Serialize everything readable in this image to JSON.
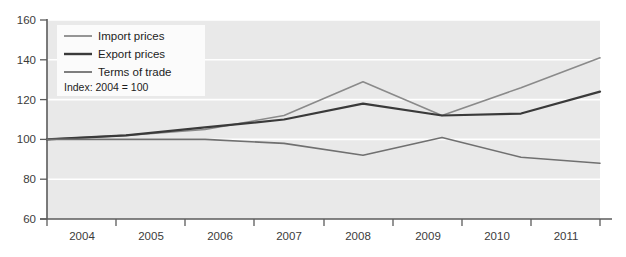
{
  "chart_data": {
    "type": "line",
    "title": "",
    "subtitle": "",
    "xlabel": "",
    "ylabel": "",
    "annotation": "Index: 2004 = 100",
    "legend_position": "top-left",
    "grid": true,
    "x": [
      "2004",
      "2005",
      "2006",
      "2007",
      "2008",
      "2009",
      "2010",
      "2011"
    ],
    "categories": [
      "2004",
      "2005",
      "2006",
      "2007",
      "2008",
      "2009",
      "2010",
      "2011"
    ],
    "xlim": [
      2004,
      2011
    ],
    "ylim": [
      60,
      160
    ],
    "yticks": [
      "60",
      "80",
      "100",
      "120",
      "140",
      "160"
    ],
    "series": [
      {
        "name": "Import prices",
        "color": "#8a8a8a",
        "values": [
          100,
          102,
          105,
          112,
          129,
          112,
          126,
          141
        ]
      },
      {
        "name": "Export prices",
        "color": "#3a3a3a",
        "values": [
          100,
          102,
          106,
          110,
          118,
          112,
          113,
          124
        ]
      },
      {
        "name": "Terms of trade",
        "color": "#707070",
        "values": [
          100,
          100,
          100,
          98,
          92,
          101,
          91,
          88
        ]
      }
    ]
  },
  "legend": {
    "items": [
      {
        "label": "Import prices"
      },
      {
        "label": "Export prices"
      },
      {
        "label": "Terms of trade"
      }
    ],
    "note": "Index: 2004 = 100"
  },
  "axes": {
    "y_tick_labels": [
      "160",
      "140",
      "120",
      "100",
      "80",
      "60"
    ],
    "x_tick_labels": [
      "2004",
      "2005",
      "2006",
      "2007",
      "2008",
      "2009",
      "2010",
      "2011"
    ]
  },
  "colors": {
    "plot_background": "#e9e9e9",
    "page_background": "#ffffff",
    "gridline": "#ffffff",
    "axis": "#5b5b5b",
    "legend_background": "#fbfbfb"
  }
}
